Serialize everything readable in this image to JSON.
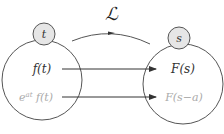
{
  "diagram": {
    "transform_label": "ℒ",
    "domain_left": {
      "variable": "t",
      "items": [
        {
          "text": "f(t)",
          "color": "#333333"
        },
        {
          "text_base": "e",
          "text_sup": "at",
          "text_rest": " f(t)",
          "color": "#aaaaaa"
        }
      ]
    },
    "domain_right": {
      "variable": "s",
      "items": [
        {
          "text": "F(s)",
          "color": "#333333"
        },
        {
          "text": "F(s−a)",
          "color": "#aaaaaa"
        }
      ]
    },
    "colors": {
      "stroke": "#555555",
      "small_circle_fill": "#e6e6e6",
      "text_primary": "#333333",
      "text_muted": "#aaaaaa"
    }
  }
}
